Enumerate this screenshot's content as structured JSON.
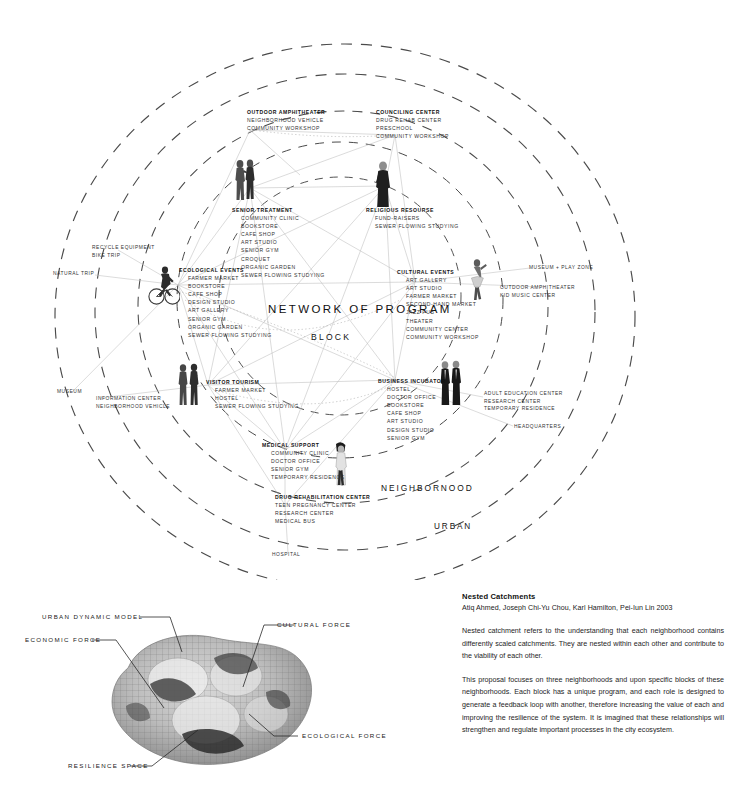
{
  "poster": {
    "tiers": {
      "network": "NETWORK OF PROGRAM",
      "block": "BLOCK",
      "neighborhood": "NEIGHBORNOOD",
      "urban": "URBAN"
    },
    "clusters": [
      {
        "id": "outdoor-amphitheater",
        "head": "OUTDOOR AMPHITHEATER",
        "items": [
          "NEIGHBORHOOD VEHICLE",
          "COMMUNITY WORKSHOP"
        ],
        "indent": false
      },
      {
        "id": "counciling-center",
        "head": "COUNCILING CENTER",
        "items": [
          "DRUG REHAB CENTER",
          "PRESCHOOL",
          "COMMUNITY WORKSHOP"
        ],
        "indent": false
      },
      {
        "id": "senior-treatment",
        "head": "SENIOR TREATMENT",
        "items": [
          "COMMUNITY CLINIC",
          "BOOKSTORE",
          "CAFE SHOP",
          "ART STUDIO",
          "SENIOR GYM",
          "CROQUET",
          "ORGANIC GARDEN",
          "SEWER FLOWING STUDYING"
        ],
        "indent": true
      },
      {
        "id": "religious-resource",
        "head": "RELIGIOUS RESOURSE",
        "items": [
          "FUND-RAISERS",
          "SEWER FLOWING STUDYING"
        ],
        "indent": true
      },
      {
        "id": "ecological-events",
        "head": "ECOLOGICAL EVENTS",
        "items": [
          "FARMER MARKET",
          "BOOKSTORE",
          "CAFE SHOP",
          "DESIGN STUDIO",
          "ART GALLERY",
          "SENIOR GYM",
          "ORGANIC GARDEN",
          "SEWER FLOWING STUDYING"
        ],
        "indent": true
      },
      {
        "id": "cultural-events",
        "head": "CULTURAL EVENTS",
        "items": [
          "ART GALLERY",
          "ART STUDIO",
          "FARMER MARKET",
          "SECOND-HAND MARKET",
          "JAZZ PUB",
          "THEATER",
          "COMMUNITY CENTER",
          "COMMUNITY WORKSHOP"
        ],
        "indent": true
      },
      {
        "id": "visitor-tourism",
        "head": "VISITOR TOURISM",
        "items": [
          "FARMER MARKET",
          "HOSTEL",
          "SEWER FLOWING STUDYING"
        ],
        "indent": true
      },
      {
        "id": "business-incubator",
        "head": "BUSINESS INCUBATOR",
        "items": [
          "HOSTEL",
          "DOCTOR OFFICE",
          "BOOKSTORE",
          "CAFE SHOP",
          "ART STUDIO",
          "DESIGN STUDIO",
          "SENIOR GYM"
        ],
        "indent": true
      },
      {
        "id": "medical-support",
        "head": "MEDICAL SUPPORT",
        "items": [
          "COMMUNITY CLINIC",
          "DOCTOR OFFICE",
          "SENIOR GYM",
          "TEMPORARY RESIDENCE"
        ],
        "indent": true
      },
      {
        "id": "drug-rehabilitation-center",
        "head": "DRUG REHABILITATION CENTER",
        "items": [
          "TEEN PREGNANCY CENTER",
          "RESEARCH CENTER",
          "MEDICAL BUS"
        ],
        "indent": false
      }
    ],
    "peripheral": [
      {
        "id": "recycle-equipment",
        "lines": [
          "RECYCLE EQUIPMENT",
          "BIKE TRIP"
        ]
      },
      {
        "id": "natural-trip",
        "lines": [
          "NATURAL TRIP"
        ]
      },
      {
        "id": "museum",
        "lines": [
          "MUSEUM"
        ]
      },
      {
        "id": "information-center",
        "lines": [
          "INFORMATION CENTER",
          "NEIGHBORHOOD VEHICLE"
        ]
      },
      {
        "id": "museum-play-zone",
        "lines": [
          "MUSEUM + PLAY ZONE"
        ]
      },
      {
        "id": "outdoor-amphitheater-kid",
        "lines": [
          "OUTDOOR AMPHITHEATER",
          "KID MUSIC CENTER"
        ]
      },
      {
        "id": "adult-education-center",
        "lines": [
          "ADULT EDUCATION CENTER",
          "RESEARCH CENTER",
          "TEMPORARY RESIDENCE"
        ]
      },
      {
        "id": "headquarters",
        "lines": [
          "HEADQUARTERS"
        ]
      },
      {
        "id": "hospital",
        "lines": [
          "HOSPITAL"
        ]
      }
    ]
  },
  "blob": {
    "labels": [
      {
        "id": "urban-dynamic-model",
        "text": "URBAN DYNAMIC MODEL"
      },
      {
        "id": "cultural-force",
        "text": "CULTURAL FORCE"
      },
      {
        "id": "economic-force",
        "text": "ECONOMIC FORCE"
      },
      {
        "id": "ecological-force",
        "text": "ECOLOGICAL FORCE"
      },
      {
        "id": "resilience-space",
        "text": "RESILIENCE SPACE"
      }
    ]
  },
  "caption": {
    "title": "Nested Catchments",
    "authors": "Atiq Ahmed, Joseph Chi-Yu Chou, Karl Hamilton, Pei-Iun Lin 2003",
    "paragraph1": "Nested catchment refers to the understanding that each neighborhood contains differently scaled catchments. They are nested within each other and contribute to the viability of each other.",
    "paragraph2": "This proposal focuses on three neighborhoods and upon specific blocks of these neighborhoods. Each block has a unique program, and each role is designed to generate a feedback loop with another, therefore increasing the value of each and improving the resilience of the system. It is imagined that these relationships will strengthen and regulate important processes in the city ecosystem."
  },
  "colors": {
    "ink": "#1a1a1a",
    "dash": "#4a4a4a",
    "web": "#b9b9b9",
    "paper": "#ffffff"
  }
}
